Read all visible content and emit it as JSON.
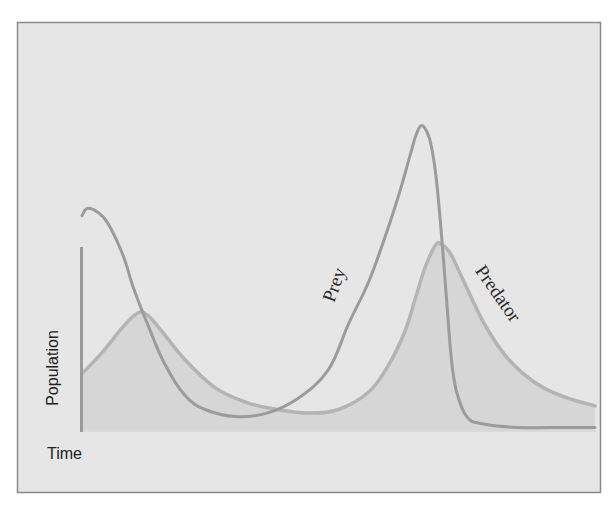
{
  "chart_data": {
    "type": "line",
    "title": "",
    "xlabel": "Time",
    "ylabel": "Population",
    "grid": false,
    "legend": "inline labels on curves",
    "x_ticks": [],
    "y_ticks": [],
    "xlim": [
      0,
      100
    ],
    "ylim": [
      0,
      100
    ],
    "series": [
      {
        "name": "Prey",
        "filled": false,
        "color": "#9b9b9b",
        "x": [
          0,
          1,
          3,
          5,
          8,
          10,
          13,
          16,
          20,
          24,
          30,
          36,
          42,
          48,
          52,
          56,
          60,
          62,
          64,
          65,
          66,
          67,
          68,
          69,
          70,
          71,
          72,
          73,
          75,
          78,
          85,
          95,
          100
        ],
        "values": [
          60,
          62,
          61,
          58,
          49,
          40,
          29,
          19,
          10,
          6,
          4,
          5,
          9,
          17,
          30,
          42,
          58,
          67,
          77,
          82,
          85,
          84,
          80,
          71,
          56,
          38,
          20,
          11,
          4,
          2,
          1,
          1,
          1
        ]
      },
      {
        "name": "Predator",
        "filled": true,
        "color": "#b4b4b4",
        "x": [
          0,
          4,
          8,
          11,
          13,
          16,
          20,
          26,
          32,
          38,
          44,
          50,
          56,
          60,
          63,
          65,
          67,
          69,
          70,
          71,
          72,
          74,
          78,
          82,
          86,
          90,
          95,
          100
        ],
        "values": [
          16,
          22,
          29,
          33,
          32,
          27,
          20,
          12,
          8,
          6,
          5,
          6,
          11,
          19,
          28,
          37,
          46,
          52,
          52,
          51,
          49,
          43,
          31,
          22,
          16,
          12,
          9,
          7
        ]
      }
    ],
    "annotations": [
      {
        "text": "Prey",
        "near_series": "Prey",
        "rotation_deg": -70
      },
      {
        "text": "Predator",
        "near_series": "Predator",
        "rotation_deg": 55
      }
    ]
  },
  "labels": {
    "x_axis": "Time",
    "y_axis": "Population",
    "prey": "Prey",
    "predator": "Predator"
  },
  "colors": {
    "background": "#e6e6e6",
    "frame": "#8a8a8a",
    "prey_line": "#9b9b9b",
    "predator_line": "#b4b4b4",
    "predator_fill": "#d2d2d2",
    "text": "#222222"
  }
}
